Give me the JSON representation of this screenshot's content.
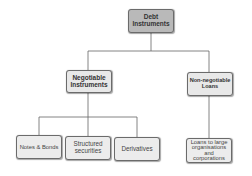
{
  "diagram": {
    "type": "hierarchy-tree",
    "colors": {
      "root_fill": "#b9b9b9",
      "node_fill": "#e8e8e8",
      "border": "#6b6b6b",
      "connector": "#666666"
    },
    "root": {
      "label": "Debt Instruments",
      "line1": "Debt",
      "line2": "Instruments"
    },
    "level1": [
      {
        "label": "Negotiable Instruments",
        "line1": "Negotiable",
        "line2": "Instruments"
      },
      {
        "label": "Non-negotiable Loans",
        "line1": "Non-negotiable",
        "line2": "Loans"
      }
    ],
    "level2": [
      {
        "parent": "Negotiable Instruments",
        "label": "Notes & Bonds",
        "line1": "Notes & Bonds"
      },
      {
        "parent": "Negotiable Instruments",
        "label": "Structured securities",
        "line1": "Structured",
        "line2": "securities"
      },
      {
        "parent": "Negotiable Instruments",
        "label": "Derivatives",
        "line1": "Derivatives"
      },
      {
        "parent": "Non-negotiable Loans",
        "label": "Loans to large organisations and corporations",
        "line1": "Loans to large",
        "line2": "organisations",
        "line3": "and",
        "line4": "corporations"
      }
    ]
  }
}
